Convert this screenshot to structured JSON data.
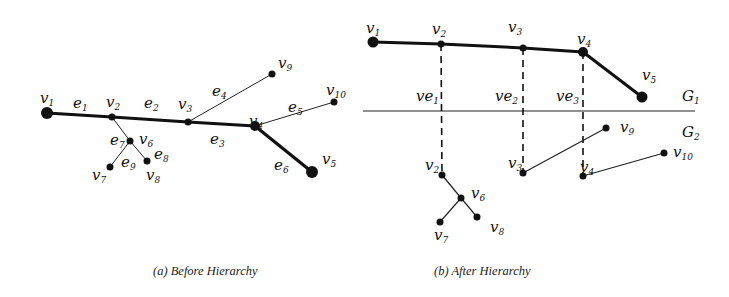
{
  "figure": {
    "panel_a": {
      "caption": "(a) Before Hierarchy",
      "nodes": {
        "v1": {
          "label": "v",
          "sub": "1",
          "x": 47,
          "y": 113,
          "r": 6
        },
        "v2": {
          "label": "v",
          "sub": "2",
          "x": 112,
          "y": 117,
          "r": 3.5
        },
        "v3": {
          "label": "v",
          "sub": "3",
          "x": 188,
          "y": 122,
          "r": 3.5
        },
        "v4": {
          "label": "v",
          "sub": "4",
          "x": 255,
          "y": 126,
          "r": 5
        },
        "v5": {
          "label": "v",
          "sub": "5",
          "x": 312,
          "y": 172,
          "r": 6
        },
        "v6": {
          "label": "v",
          "sub": "6",
          "x": 130,
          "y": 141,
          "r": 3.5
        },
        "v7": {
          "label": "v",
          "sub": "7",
          "x": 110,
          "y": 167,
          "r": 3.5
        },
        "v8": {
          "label": "v",
          "sub": "8",
          "x": 147,
          "y": 161,
          "r": 3.5
        },
        "v9": {
          "label": "v",
          "sub": "9",
          "x": 272,
          "y": 74,
          "r": 3.5
        },
        "v10": {
          "label": "v",
          "sub": "10",
          "x": 334,
          "y": 102,
          "r": 3.5
        }
      },
      "edges": [
        {
          "id": "e1",
          "label": "e",
          "sub": "1",
          "from": "v1",
          "to": "v2",
          "bold": true
        },
        {
          "id": "e2",
          "label": "e",
          "sub": "2",
          "from": "v2",
          "to": "v3",
          "bold": true
        },
        {
          "id": "e3",
          "label": "e",
          "sub": "3",
          "from": "v3",
          "to": "v4",
          "bold": true
        },
        {
          "id": "e4",
          "label": "e",
          "sub": "4",
          "from": "v3",
          "to": "v9",
          "bold": false
        },
        {
          "id": "e5",
          "label": "e",
          "sub": "5",
          "from": "v4",
          "to": "v10",
          "bold": false
        },
        {
          "id": "e6",
          "label": "e",
          "sub": "6",
          "from": "v4",
          "to": "v5",
          "bold": true
        },
        {
          "id": "e7",
          "label": "e",
          "sub": "7",
          "from": "v2",
          "to": "v6",
          "bold": false
        },
        {
          "id": "e8",
          "label": "e",
          "sub": "8",
          "from": "v6",
          "to": "v8",
          "bold": false
        },
        {
          "id": "e9",
          "label": "e",
          "sub": "9",
          "from": "v6",
          "to": "v7",
          "bold": false
        }
      ]
    },
    "panel_b": {
      "caption": "(b) After Hierarchy",
      "layer_labels": {
        "g1": {
          "label": "G",
          "sub": "1"
        },
        "g2": {
          "label": "G",
          "sub": "2"
        }
      },
      "virtual_edges": [
        {
          "label": "ve",
          "sub": "1"
        },
        {
          "label": "ve",
          "sub": "2"
        },
        {
          "label": "ve",
          "sub": "3"
        }
      ]
    }
  }
}
